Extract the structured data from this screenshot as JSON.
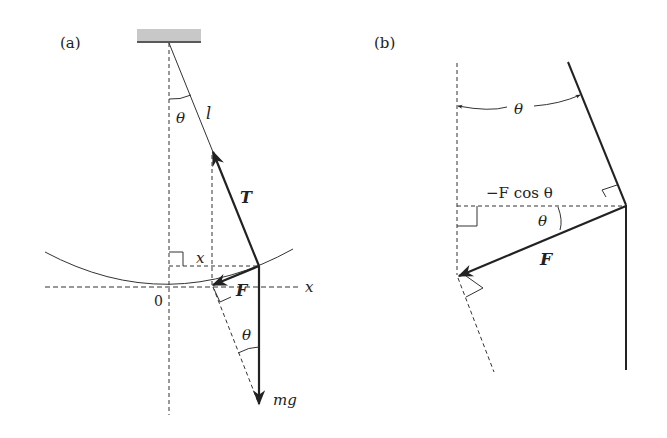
{
  "panels": [
    {
      "id": "a",
      "label": "(a)",
      "labels": {
        "theta": "θ",
        "length": "l",
        "tension": "T",
        "displacement": "x",
        "force": "F",
        "axis_x": "x",
        "origin": "0",
        "theta2": "θ",
        "weight": "mg"
      }
    },
    {
      "id": "b",
      "label": "(b)",
      "labels": {
        "theta_top": "θ",
        "component": "−F cos θ",
        "theta_mid": "θ",
        "force": "F"
      }
    }
  ],
  "colors": {
    "line": "#222222",
    "ceiling_fill": "#bfbfbf"
  }
}
